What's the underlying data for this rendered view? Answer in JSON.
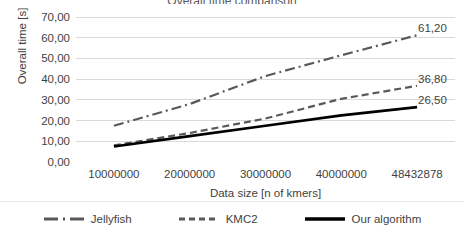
{
  "title_clipped": "Overall time comparison",
  "axes": {
    "y_title": "Overall time [s]",
    "x_title": "Data size [n of kmers]",
    "y_ticks": [
      "70,00",
      "60,00",
      "50,00",
      "40,00",
      "30,00",
      "20,00",
      "10,00",
      "0,00"
    ],
    "x_ticks": [
      "10000000",
      "20000000",
      "30000000",
      "40000000",
      "48432878"
    ]
  },
  "legend": {
    "items": [
      {
        "label": "Jellyfish",
        "style": "dash-dot",
        "color": "#595959"
      },
      {
        "label": "KMC2",
        "style": "dashed",
        "color": "#595959"
      },
      {
        "label": "Our algorithm",
        "style": "solid",
        "color": "#000000"
      }
    ]
  },
  "end_labels": {
    "jellyfish": "61,20",
    "kmc2": "36,80",
    "our_algorithm": "26,50"
  },
  "colors": {
    "gridline": "#d9d9d9",
    "axis_line": "#d9d9d9",
    "jellyfish": "#595959",
    "kmc2": "#595959",
    "our_algorithm": "#000000",
    "text": "#3f3f3f",
    "background": "#ffffff"
  },
  "chart_data": {
    "type": "line",
    "title": "Overall time comparison",
    "xlabel": "Data size [n of kmers]",
    "ylabel": "Overall time [s]",
    "categories": [
      "10000000",
      "20000000",
      "30000000",
      "40000000",
      "48432878"
    ],
    "x_numeric": [
      10000000,
      20000000,
      30000000,
      40000000,
      48432878
    ],
    "ylim": [
      0,
      70
    ],
    "y_ticks": [
      0,
      10,
      20,
      30,
      40,
      50,
      60,
      70
    ],
    "grid": true,
    "legend_position": "bottom",
    "series": [
      {
        "name": "Jellyfish",
        "style": "dash-dot",
        "values": [
          17.5,
          28.0,
          41.5,
          51.5,
          61.2
        ],
        "end_label": "61,20"
      },
      {
        "name": "KMC2",
        "style": "dashed",
        "values": [
          8.0,
          14.0,
          21.0,
          30.5,
          36.8
        ],
        "end_label": "36,80"
      },
      {
        "name": "Our algorithm",
        "style": "solid",
        "values": [
          7.5,
          12.5,
          17.5,
          22.5,
          26.5
        ],
        "end_label": "26,50"
      }
    ]
  }
}
